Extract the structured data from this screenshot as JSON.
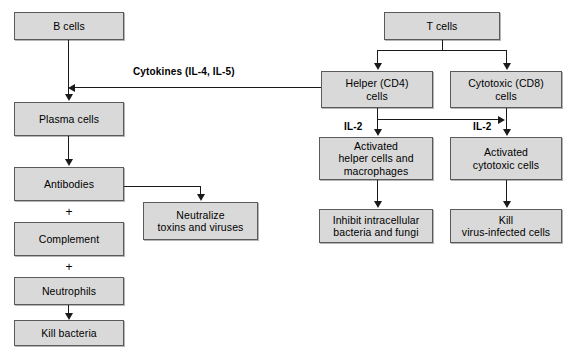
{
  "diagram": {
    "background_color": "#ffffff",
    "box_fill_color": "#d9d9d9",
    "box_border_color": "#5a5a5a",
    "connector_color": "#1a1a1a",
    "nodes": {
      "b_cells": "B cells",
      "plasma_cells": "Plasma cells",
      "antibodies": "Antibodies",
      "complement": "Complement",
      "neutrophils": "Neutrophils",
      "kill_bacteria": "Kill bacteria",
      "neutralize": "Neutralize\ntoxins and viruses",
      "t_cells": "T cells",
      "helper_cd4": "Helper (CD4)\ncells",
      "cytotoxic_cd8": "Cytotoxic (CD8)\ncells",
      "activated_helper": "Activated\nhelper cells and\nmacrophages",
      "activated_cytotoxic": "Activated\ncytotoxic cells",
      "inhibit_intracellular": "Inhibit intracellular\nbacteria and fungi",
      "kill_virus_infected": "Kill\nvirus-infected cells"
    },
    "edge_labels": {
      "cytokines": "Cytokines (IL-4, IL-5)",
      "il2_left": "IL-2",
      "il2_right": "IL-2"
    },
    "operators": {
      "plus_antibodies_complement": "+",
      "plus_complement_neutrophils": "+"
    }
  }
}
